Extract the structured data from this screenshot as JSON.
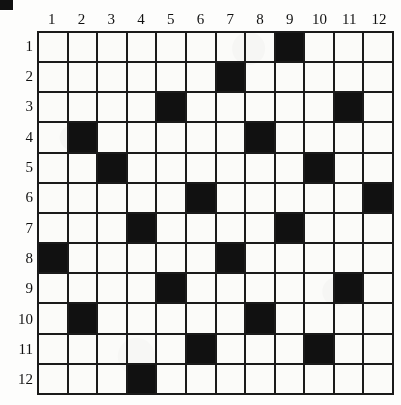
{
  "page": {
    "corner_marker": "black-square-artifact"
  },
  "grid": {
    "rows": 12,
    "cols": 12,
    "column_headers": [
      "1",
      "2",
      "3",
      "4",
      "5",
      "6",
      "7",
      "8",
      "9",
      "10",
      "11",
      "12"
    ],
    "row_headers": [
      "1",
      "2",
      "3",
      "4",
      "5",
      "6",
      "7",
      "8",
      "9",
      "10",
      "11",
      "12"
    ],
    "filled_color": "#111111",
    "empty_color": "#fbfbf9",
    "line_color": "#1a1a1a"
  },
  "chart_data": {
    "type": "heatmap",
    "xlabel": "",
    "ylabel": "",
    "x": [
      "1",
      "2",
      "3",
      "4",
      "5",
      "6",
      "7",
      "8",
      "9",
      "10",
      "11",
      "12"
    ],
    "y": [
      "1",
      "2",
      "3",
      "4",
      "5",
      "6",
      "7",
      "8",
      "9",
      "10",
      "11",
      "12"
    ],
    "legend": [],
    "grid": true,
    "values": [
      [
        0,
        0,
        0,
        0,
        0,
        0,
        0,
        0,
        1,
        0,
        0,
        0
      ],
      [
        0,
        0,
        0,
        0,
        0,
        0,
        1,
        0,
        0,
        0,
        0,
        0
      ],
      [
        0,
        0,
        0,
        0,
        1,
        0,
        0,
        0,
        0,
        0,
        1,
        0
      ],
      [
        0,
        1,
        0,
        0,
        0,
        0,
        0,
        1,
        0,
        0,
        0,
        0
      ],
      [
        0,
        0,
        1,
        0,
        0,
        0,
        0,
        0,
        0,
        1,
        0,
        0
      ],
      [
        0,
        0,
        0,
        0,
        0,
        1,
        0,
        0,
        0,
        0,
        0,
        1
      ],
      [
        0,
        0,
        0,
        1,
        0,
        0,
        0,
        0,
        1,
        0,
        0,
        0
      ],
      [
        1,
        0,
        0,
        0,
        0,
        0,
        1,
        0,
        0,
        0,
        0,
        0
      ],
      [
        0,
        0,
        0,
        0,
        1,
        0,
        0,
        0,
        0,
        0,
        1,
        0
      ],
      [
        0,
        1,
        0,
        0,
        0,
        0,
        0,
        1,
        0,
        0,
        0,
        0
      ],
      [
        0,
        0,
        0,
        0,
        0,
        1,
        0,
        0,
        0,
        1,
        0,
        0
      ],
      [
        0,
        0,
        0,
        1,
        0,
        0,
        0,
        0,
        0,
        0,
        0,
        0
      ]
    ],
    "filled_cells": [
      {
        "row": 1,
        "cols": [
          9
        ]
      },
      {
        "row": 2,
        "cols": [
          7
        ]
      },
      {
        "row": 3,
        "cols": [
          5,
          11
        ]
      },
      {
        "row": 4,
        "cols": [
          2,
          8
        ]
      },
      {
        "row": 5,
        "cols": [
          3,
          10
        ]
      },
      {
        "row": 6,
        "cols": [
          6,
          12
        ]
      },
      {
        "row": 7,
        "cols": [
          4,
          9
        ]
      },
      {
        "row": 8,
        "cols": [
          1,
          7
        ]
      },
      {
        "row": 9,
        "cols": [
          5,
          11
        ]
      },
      {
        "row": 10,
        "cols": [
          2,
          8
        ]
      },
      {
        "row": 11,
        "cols": [
          6,
          10
        ]
      },
      {
        "row": 12,
        "cols": [
          4
        ]
      }
    ],
    "filled_count": 23
  }
}
